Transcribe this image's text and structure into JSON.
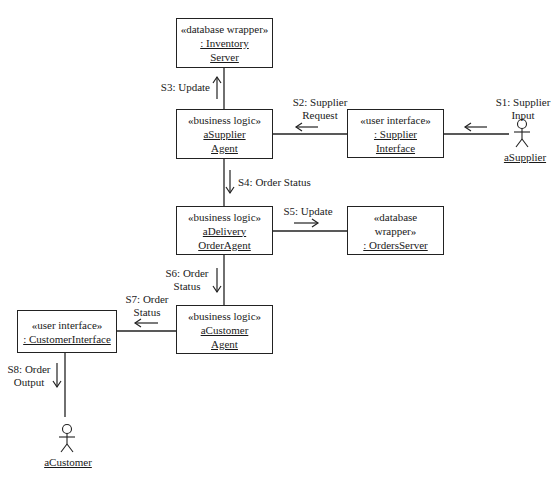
{
  "diagram": {
    "type": "UML communication diagram",
    "objects": [
      {
        "id": "inventory_server",
        "stereotype": "«database wrapper»",
        "name_lines": [
          ": Inventory",
          "Server"
        ]
      },
      {
        "id": "supplier_agent",
        "stereotype": "«business logic»",
        "name_lines": [
          "aSupplier",
          "Agent"
        ]
      },
      {
        "id": "supplier_interface",
        "stereotype": "«user interface»",
        "name_lines": [
          ": Supplier",
          "Interface"
        ]
      },
      {
        "id": "delivery_order_agent",
        "stereotype": "«business logic»",
        "name_lines": [
          "aDelivery",
          "OrderAgent"
        ]
      },
      {
        "id": "orders_server",
        "stereotype_lines": [
          "«database",
          "wrapper»"
        ],
        "name_lines": [
          ": OrdersServer"
        ]
      },
      {
        "id": "customer_agent",
        "stereotype": "«business logic»",
        "name_lines": [
          "aCustomer",
          "Agent"
        ]
      },
      {
        "id": "customer_interface",
        "stereotype": "«user interface»",
        "name_lines": [
          ": CustomerInterface"
        ]
      }
    ],
    "actors": [
      {
        "id": "supplier_actor",
        "name": "aSupplier"
      },
      {
        "id": "customer_actor",
        "name": "aCustomer"
      }
    ],
    "messages": [
      {
        "id": "s1",
        "lines": [
          "S1: Supplier",
          "Input"
        ],
        "from": "aSupplier",
        "to": ": Supplier Interface",
        "arrow": "←"
      },
      {
        "id": "s2",
        "lines": [
          "S2: Supplier",
          "Request"
        ],
        "from": ": Supplier Interface",
        "to": "aSupplier Agent",
        "arrow": "←"
      },
      {
        "id": "s3",
        "lines": [
          "S3: Update"
        ],
        "from": "aSupplier Agent",
        "to": ": Inventory Server",
        "arrow": "↑"
      },
      {
        "id": "s4",
        "lines": [
          "S4: Order Status"
        ],
        "from": "aSupplier Agent",
        "to": "aDelivery OrderAgent",
        "arrow": "↓"
      },
      {
        "id": "s5",
        "lines": [
          "S5: Update"
        ],
        "from": "aDelivery OrderAgent",
        "to": ": OrdersServer",
        "arrow": "→"
      },
      {
        "id": "s6",
        "lines": [
          "S6: Order",
          "Status"
        ],
        "from": "aDelivery OrderAgent",
        "to": "aCustomer Agent",
        "arrow": "↓"
      },
      {
        "id": "s7",
        "lines": [
          "S7: Order",
          "Status"
        ],
        "from": "aCustomer Agent",
        "to": ": CustomerInterface",
        "arrow": "←"
      },
      {
        "id": "s8",
        "lines": [
          "S8: Order",
          "Output"
        ],
        "from": ": CustomerInterface",
        "to": "aCustomer",
        "arrow": "↓"
      }
    ]
  }
}
